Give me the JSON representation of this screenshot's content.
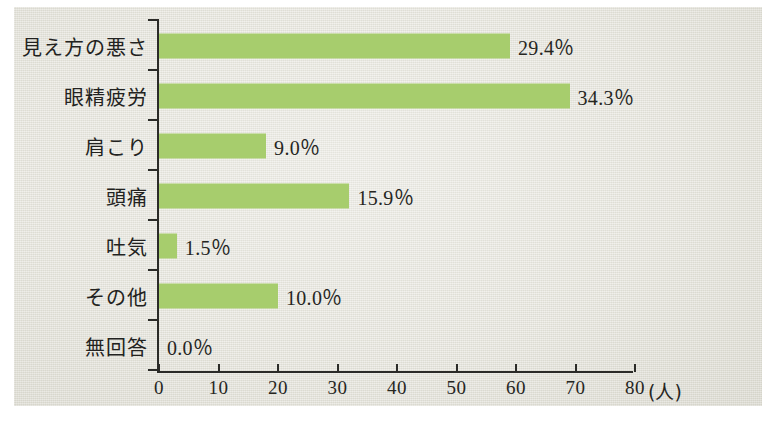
{
  "chart_data": {
    "type": "bar",
    "orientation": "horizontal",
    "title": "",
    "xlabel": "(人)",
    "ylabel": "",
    "xlim": [
      0,
      80
    ],
    "xticks": [
      0,
      10,
      20,
      30,
      40,
      50,
      60,
      70,
      80
    ],
    "xtick_labels": [
      "0",
      "10",
      "20",
      "30",
      "40",
      "50",
      "60",
      "70",
      "80"
    ],
    "x_axis_unit": "(人)",
    "grid": false,
    "legend": false,
    "bar_color": "#a7cd6d",
    "panel_color": "#e3e2d8",
    "axis_color": "#2b2b28",
    "text_color": "#26261f",
    "categories": [
      "見え方の悪さ",
      "眼精疲労",
      "肩こり",
      "頭痛",
      "吐気",
      "その他",
      "無回答"
    ],
    "values": [
      59,
      69,
      18,
      32,
      3,
      20,
      0
    ],
    "value_unit": "人",
    "data_labels": [
      "29.4％",
      "34.3％",
      "9.0％",
      "15.9％",
      "1.5％",
      "10.0％",
      "0.0％"
    ],
    "percentages": [
      29.4,
      34.3,
      9.0,
      15.9,
      1.5,
      10.0,
      0.0
    ]
  }
}
